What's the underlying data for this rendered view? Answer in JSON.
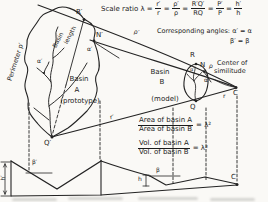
{
  "figure": {
    "scale_formula": {
      "label": "Scale ratio λ =",
      "eq": "=",
      "fractions": [
        {
          "num": "r′",
          "den": "r"
        },
        {
          "num": "ρ′",
          "den": "ρ"
        },
        {
          "num": "R′Q′",
          "den": "RQ"
        },
        {
          "num": "P′",
          "den": "P"
        },
        {
          "num": "h′",
          "den": "h"
        }
      ]
    },
    "corresponding_angles": {
      "line1": "Corresponding angles: α′ = α",
      "line2": "β′ = β"
    },
    "basin_a": {
      "word1": "Basin",
      "word2": "A",
      "word3": "(prototype)"
    },
    "basin_b": {
      "word1": "Basin",
      "word2": "B",
      "word3": "(model)"
    },
    "rotated_labels": {
      "perimeter": "Perimeter p′",
      "basin": "Basin",
      "length": "length"
    },
    "center_of_similitude": {
      "line1": "Center of",
      "line2": "similitude"
    },
    "ratio_formulas": {
      "area": {
        "num": "Area of basin A",
        "den": "Area of basin B",
        "result": "= λ²"
      },
      "vol": {
        "num": "Vol. of basin A",
        "den": "Vol. of basin B",
        "result": "= λ³"
      }
    },
    "point_labels": {
      "R_prime": "R′",
      "N_prime": "N′",
      "Q_prime": "Q′",
      "alpha_prime_edge": "α′",
      "alpha_prime_junction": "α′",
      "rho_prime": "ρ′",
      "r_prime": "r′",
      "R": "R",
      "N": "N",
      "Q": "Q",
      "alpha": "α",
      "alpha_prime_model": "α′",
      "rho": "ρ",
      "r": "r",
      "C_center": "C",
      "C_base": "C",
      "h_prime": "h′",
      "beta_prime": "β′",
      "h": "h",
      "beta": "β"
    }
  }
}
